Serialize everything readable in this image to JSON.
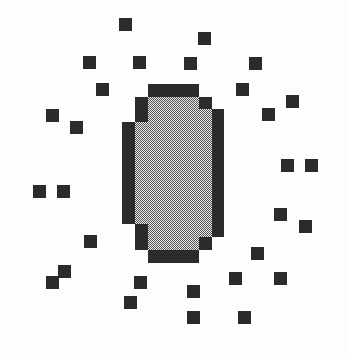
{
  "image": {
    "title": "Pixelated sun burst icon",
    "width": 349,
    "height": 358,
    "background_color": "#fdfdfd"
  },
  "palette": {
    "background": "#fdfdfd",
    "outline_dark": "#2b2b2b",
    "spark_dark": "#2b2b2b",
    "fill_light": "#d6d6d6",
    "dither_dark": "#4a4a4a"
  },
  "graphic": {
    "name": "pixel-sun",
    "grid_cell_px": 12.7,
    "circle": {
      "name": "dithered-disc",
      "center_x": 173,
      "center_y": 173,
      "diameter_px": 178,
      "outline_thickness_px": 13,
      "fill_pattern": "checkerboard-dither-50",
      "fill_color": "#d6d6d6",
      "outline_color": "#2b2b2b",
      "outline_cells": [
        {
          "x": 2,
          "y": 0,
          "w": 4,
          "h": 1
        },
        {
          "x": 1,
          "y": 1,
          "w": 1,
          "h": 1
        },
        {
          "x": 6,
          "y": 1,
          "w": 1,
          "h": 1
        },
        {
          "x": 0,
          "y": 2,
          "w": 1,
          "h": 1
        },
        {
          "x": 7,
          "y": 2,
          "w": 1,
          "h": 1
        }
      ],
      "step_profile_cells": [
        4,
        6,
        7,
        8,
        8,
        8,
        8,
        8,
        8,
        8,
        8,
        7,
        6,
        4
      ]
    },
    "sparks": {
      "name": "spark-squares",
      "count": 29,
      "size_px": 13,
      "color": "#2b2b2b",
      "positions": [
        {
          "x": 119,
          "y": 18
        },
        {
          "x": 198,
          "y": 32
        },
        {
          "x": 83,
          "y": 56
        },
        {
          "x": 133,
          "y": 56
        },
        {
          "x": 184,
          "y": 57
        },
        {
          "x": 249,
          "y": 57
        },
        {
          "x": 96,
          "y": 83
        },
        {
          "x": 236,
          "y": 83
        },
        {
          "x": 286,
          "y": 95
        },
        {
          "x": 46,
          "y": 109
        },
        {
          "x": 262,
          "y": 108
        },
        {
          "x": 70,
          "y": 121
        },
        {
          "x": 281,
          "y": 159
        },
        {
          "x": 305,
          "y": 159
        },
        {
          "x": 33,
          "y": 185
        },
        {
          "x": 57,
          "y": 185
        },
        {
          "x": 274,
          "y": 208
        },
        {
          "x": 299,
          "y": 220
        },
        {
          "x": 84,
          "y": 235
        },
        {
          "x": 251,
          "y": 247
        },
        {
          "x": 58,
          "y": 265
        },
        {
          "x": 46,
          "y": 276
        },
        {
          "x": 134,
          "y": 276
        },
        {
          "x": 229,
          "y": 272
        },
        {
          "x": 274,
          "y": 272
        },
        {
          "x": 187,
          "y": 285
        },
        {
          "x": 124,
          "y": 296
        },
        {
          "x": 238,
          "y": 311
        },
        {
          "x": 187,
          "y": 311
        }
      ]
    }
  }
}
